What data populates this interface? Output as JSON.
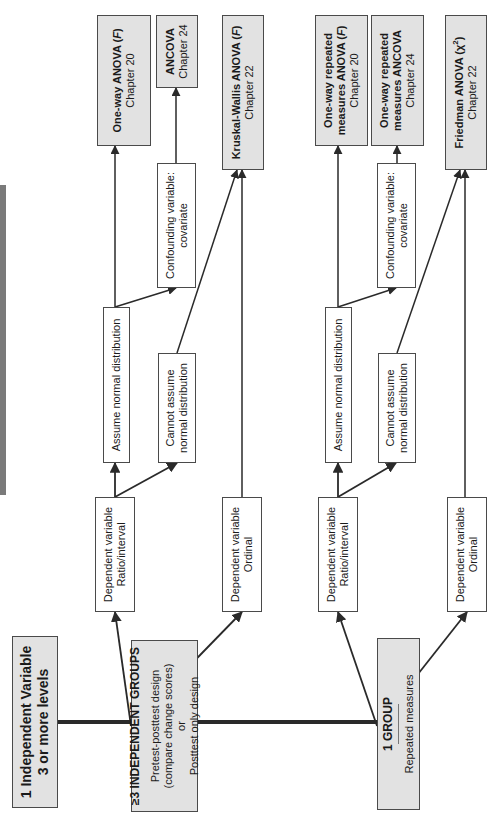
{
  "root": {
    "line1": "1 Independent Variable",
    "line2": "3 or more levels"
  },
  "groups": [
    {
      "title": "≥3 INDEPENDENT GROUPS",
      "lines": [
        "Pretest-posttest design",
        "(compare change scores)",
        "or",
        "Posttest only design"
      ],
      "dv_ratio": {
        "line1": "Dependent variable",
        "line2": "Ratio/interval"
      },
      "dv_ordinal": {
        "line1": "Dependent variable",
        "line2": "Ordinal"
      },
      "assume": "Assume normal distribution",
      "cannot": {
        "line1": "Cannot assume",
        "line2": "normal distribution"
      },
      "confounding": {
        "line1": "Confounding variable:",
        "line2": "covariate"
      },
      "tests": {
        "parametric": {
          "name": "One-way ANOVA (",
          "symbol": "F",
          "close": ")",
          "chapter": "Chapter 20"
        },
        "covariate": {
          "name": "ANCOVA",
          "chapter": "Chapter 24"
        },
        "nonparametric": {
          "name": "Kruskal-Wallis ANOVA (",
          "symbol": "F",
          "close": ")",
          "chapter": "Chapter 22"
        }
      }
    },
    {
      "title": "1 GROUP",
      "lines": [
        "Repeated measures"
      ],
      "dv_ratio": {
        "line1": "Dependent variable",
        "line2": "Ratio/interval"
      },
      "dv_ordinal": {
        "line1": "Dependent variable",
        "line2": "Ordinal"
      },
      "assume": "Assume normal distribution",
      "cannot": {
        "line1": "Cannot assume",
        "line2": "normal distribution"
      },
      "confounding": {
        "line1": "Confounding variable:",
        "line2": "covariate"
      },
      "tests": {
        "parametric": {
          "line1": "One-way repeated",
          "name": "measures ANOVA (",
          "symbol": "F",
          "close": ")",
          "chapter": "Chapter 20"
        },
        "covariate": {
          "line1": "One-way repeated",
          "name": "measures ANCOVA",
          "chapter": "Chapter 24"
        },
        "nonparametric": {
          "name": "Friedman ANOVA (",
          "symbol": "χ",
          "sup": "2",
          "close": ")",
          "chapter": "Chapter 22"
        }
      }
    }
  ],
  "colors": {
    "box_fill_grey": "#e2e2e2",
    "box_border": "#4a4a4a",
    "line": "#2a2a2a",
    "shade_bar": "#7a7a7a"
  }
}
